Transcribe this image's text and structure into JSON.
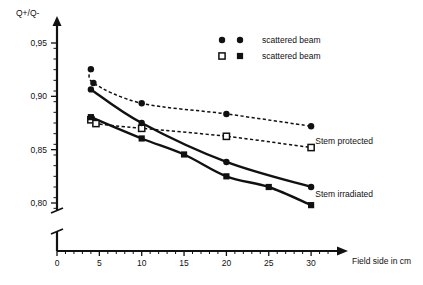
{
  "chart_data": {
    "type": "scatter",
    "title": "",
    "xlabel": "Field side in cm",
    "ylabel": "Q+/Q-",
    "xlim": [
      0,
      32
    ],
    "ylim": [
      0.785,
      0.965
    ],
    "xticks": [
      0,
      5,
      10,
      15,
      20,
      25,
      30
    ],
    "xticklabels": [
      "0",
      "5",
      "10",
      "15",
      "20",
      "25",
      "30"
    ],
    "yticks": [
      0.8,
      0.85,
      0.9,
      0.95
    ],
    "yticklabels": [
      "0,80",
      "0,85",
      "0,90",
      "0,95"
    ],
    "grid": false,
    "axis_break": true,
    "legend_position": "top-right",
    "annotations": [
      {
        "text": "Stem protected",
        "x": 30.5,
        "y": 0.858
      },
      {
        "text": "Stem irradiated",
        "x": 30.5,
        "y": 0.808
      }
    ],
    "series": [
      {
        "name": "scattered beam",
        "group": "Stem protected",
        "marker": "filled-circle",
        "line": "dashed",
        "x": [
          4,
          4.3,
          10,
          20,
          30
        ],
        "y": [
          0.9255,
          0.9125,
          0.8935,
          0.8835,
          0.872
        ]
      },
      {
        "name": "scattered beam",
        "group": "Stem protected",
        "marker": "open-square",
        "line": "dashed",
        "x": [
          4,
          4.6,
          10,
          20,
          30
        ],
        "y": [
          0.878,
          0.8745,
          0.87,
          0.8625,
          0.852
        ]
      },
      {
        "name": "scattered beam",
        "group": "Stem irradiated",
        "marker": "filled-circle",
        "line": "solid",
        "x": [
          4,
          10,
          20,
          30
        ],
        "y": [
          0.9065,
          0.875,
          0.8385,
          0.815
        ]
      },
      {
        "name": "scattered beam",
        "group": "Stem irradiated",
        "marker": "filled-square",
        "line": "solid",
        "x": [
          4,
          10,
          15,
          20,
          25,
          30
        ],
        "y": [
          0.8805,
          0.8605,
          0.8455,
          0.825,
          0.815,
          0.798
        ]
      }
    ]
  },
  "legend": {
    "rows": [
      {
        "marker_left": "filled-circle",
        "marker_right": "filled-circle",
        "label": "scattered beam"
      },
      {
        "marker_left": "open-square",
        "marker_right": "filled-square",
        "label": "scattered beam"
      }
    ]
  },
  "axes": {
    "y_title": "Q+/Q-",
    "x_title": "Field side in cm"
  },
  "colors": {
    "ink": "#111111",
    "background": "#ffffff"
  }
}
